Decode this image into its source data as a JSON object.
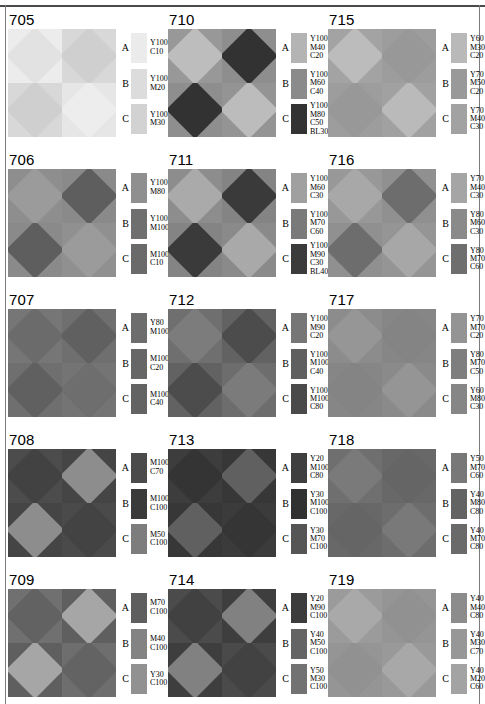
{
  "page": {
    "border_color": "#4a4a4a"
  },
  "panels": [
    {
      "number": "705",
      "swatches": [
        {
          "letter": "A",
          "lines": [
            "Y100",
            "C10"
          ],
          "color": "#ebebeb"
        },
        {
          "letter": "B",
          "lines": [
            "Y100",
            "M20"
          ],
          "color": "#dcdcdc"
        },
        {
          "letter": "C",
          "lines": [
            "Y100",
            "M30"
          ],
          "color": "#d2d2d2"
        }
      ],
      "pattern": {
        "bg": [
          "#ececec",
          "#d8d8d8",
          "#d8d8d8",
          "#e6e6e6"
        ],
        "dia": [
          "#e2e2e2",
          "#cfcfcf",
          "#cfcfcf",
          "#ededed"
        ]
      }
    },
    {
      "number": "706",
      "swatches": [
        {
          "letter": "A",
          "lines": [
            "Y100",
            "M80"
          ],
          "color": "#8f8f8f"
        },
        {
          "letter": "B",
          "lines": [
            "Y100",
            "M100"
          ],
          "color": "#6f6f6f"
        },
        {
          "letter": "C",
          "lines": [
            "M100",
            "C10"
          ],
          "color": "#6a6a6a"
        }
      ],
      "pattern": {
        "bg": [
          "#8e8e8e",
          "#8a8a8a",
          "#8a8a8a",
          "#909090"
        ],
        "dia": [
          "#9b9b9b",
          "#5e5e5e",
          "#5e5e5e",
          "#9b9b9b"
        ]
      }
    },
    {
      "number": "707",
      "swatches": [
        {
          "letter": "A",
          "lines": [
            "Y80",
            "M100"
          ],
          "color": "#6d6d6d"
        },
        {
          "letter": "B",
          "lines": [
            "M100",
            "C20"
          ],
          "color": "#666666"
        },
        {
          "letter": "C",
          "lines": [
            "M100",
            "C40"
          ],
          "color": "#636363"
        }
      ],
      "pattern": {
        "bg": [
          "#767676",
          "#6f6f6f",
          "#6f6f6f",
          "#747474"
        ],
        "dia": [
          "#6b6b6b",
          "#606060",
          "#606060",
          "#6e6e6e"
        ]
      }
    },
    {
      "number": "708",
      "swatches": [
        {
          "letter": "A",
          "lines": [
            "M100",
            "C70"
          ],
          "color": "#4b4b4b"
        },
        {
          "letter": "B",
          "lines": [
            "M100",
            "C100"
          ],
          "color": "#3a3a3a"
        },
        {
          "letter": "C",
          "lines": [
            "M50",
            "C100"
          ],
          "color": "#7d7d7d"
        }
      ],
      "pattern": {
        "bg": [
          "#4c4c4c",
          "#454545",
          "#454545",
          "#4a4a4a"
        ],
        "dia": [
          "#424242",
          "#8d8d8d",
          "#8d8d8d",
          "#434343"
        ]
      }
    },
    {
      "number": "709",
      "swatches": [
        {
          "letter": "A",
          "lines": [
            "M70",
            "C100"
          ],
          "color": "#5e5e5e"
        },
        {
          "letter": "B",
          "lines": [
            "M40",
            "C100"
          ],
          "color": "#838383"
        },
        {
          "letter": "C",
          "lines": [
            "Y30",
            "C100"
          ],
          "color": "#919191"
        }
      ],
      "pattern": {
        "bg": [
          "#707070",
          "#5f5f5f",
          "#5f5f5f",
          "#6e6e6e"
        ],
        "dia": [
          "#626262",
          "#a6a6a6",
          "#a6a6a6",
          "#636363"
        ]
      }
    },
    {
      "number": "710",
      "swatches": [
        {
          "letter": "A",
          "lines": [
            "Y100",
            "M40",
            "C20"
          ],
          "color": "#b4b4b4"
        },
        {
          "letter": "B",
          "lines": [
            "Y100",
            "M60",
            "C40"
          ],
          "color": "#8b8b8b"
        },
        {
          "letter": "C",
          "lines": [
            "Y100",
            "M80",
            "C50",
            "BL30"
          ],
          "color": "#333333"
        }
      ],
      "pattern": {
        "bg": [
          "#989898",
          "#8e8e8e",
          "#8e8e8e",
          "#949494"
        ],
        "dia": [
          "#bdbdbd",
          "#323232",
          "#323232",
          "#bcbcbc"
        ]
      }
    },
    {
      "number": "711",
      "swatches": [
        {
          "letter": "A",
          "lines": [
            "Y100",
            "M60",
            "C30"
          ],
          "color": "#a0a0a0"
        },
        {
          "letter": "B",
          "lines": [
            "Y100",
            "M70",
            "C60"
          ],
          "color": "#7a7a7a"
        },
        {
          "letter": "C",
          "lines": [
            "Y100",
            "M90",
            "C30",
            "BL40"
          ],
          "color": "#3b3b3b"
        }
      ],
      "pattern": {
        "bg": [
          "#8d8d8d",
          "#848484",
          "#848484",
          "#8a8a8a"
        ],
        "dia": [
          "#aaaaaa",
          "#3a3a3a",
          "#3a3a3a",
          "#a9a9a9"
        ]
      }
    },
    {
      "number": "712",
      "swatches": [
        {
          "letter": "A",
          "lines": [
            "Y100",
            "M90",
            "C20"
          ],
          "color": "#767676"
        },
        {
          "letter": "B",
          "lines": [
            "Y100",
            "M100",
            "C40"
          ],
          "color": "#5f5f5f"
        },
        {
          "letter": "C",
          "lines": [
            "Y100",
            "M100",
            "C80"
          ],
          "color": "#4a4a4a"
        }
      ],
      "pattern": {
        "bg": [
          "#6f6f6f",
          "#626262",
          "#626262",
          "#6d6d6d"
        ],
        "dia": [
          "#7c7c7c",
          "#4c4c4c",
          "#4c4c4c",
          "#7b7b7b"
        ]
      }
    },
    {
      "number": "713",
      "swatches": [
        {
          "letter": "A",
          "lines": [
            "Y20",
            "M100",
            "C80"
          ],
          "color": "#3f3f3f"
        },
        {
          "letter": "B",
          "lines": [
            "Y30",
            "M100",
            "C100"
          ],
          "color": "#313131"
        },
        {
          "letter": "C",
          "lines": [
            "Y30",
            "M70",
            "C100"
          ],
          "color": "#555555"
        }
      ],
      "pattern": {
        "bg": [
          "#3d3d3d",
          "#373737",
          "#373737",
          "#3b3b3b"
        ],
        "dia": [
          "#343434",
          "#606060",
          "#606060",
          "#353535"
        ]
      }
    },
    {
      "number": "714",
      "swatches": [
        {
          "letter": "A",
          "lines": [
            "Y20",
            "M90",
            "C100"
          ],
          "color": "#3c3c3c"
        },
        {
          "letter": "B",
          "lines": [
            "Y40",
            "M50",
            "C100"
          ],
          "color": "#646464"
        },
        {
          "letter": "C",
          "lines": [
            "Y50",
            "M30",
            "C100"
          ],
          "color": "#727272"
        }
      ],
      "pattern": {
        "bg": [
          "#4b4b4b",
          "#3e3e3e",
          "#3e3e3e",
          "#4a4a4a"
        ],
        "dia": [
          "#414141",
          "#818181",
          "#818181",
          "#424242"
        ]
      }
    },
    {
      "number": "715",
      "swatches": [
        {
          "letter": "A",
          "lines": [
            "Y60",
            "M30",
            "C20"
          ],
          "color": "#b9b9b9"
        },
        {
          "letter": "B",
          "lines": [
            "Y70",
            "M50",
            "C20"
          ],
          "color": "#999999"
        },
        {
          "letter": "C",
          "lines": [
            "Y70",
            "M40",
            "C30"
          ],
          "color": "#a2a2a2"
        }
      ],
      "pattern": {
        "bg": [
          "#a3a3a3",
          "#9d9d9d",
          "#9d9d9d",
          "#a1a1a1"
        ],
        "dia": [
          "#bcbcbc",
          "#989898",
          "#989898",
          "#bababa"
        ]
      }
    },
    {
      "number": "716",
      "swatches": [
        {
          "letter": "A",
          "lines": [
            "Y70",
            "M40",
            "C30"
          ],
          "color": "#a5a5a5"
        },
        {
          "letter": "B",
          "lines": [
            "Y80",
            "M60",
            "C30"
          ],
          "color": "#8a8a8a"
        },
        {
          "letter": "C",
          "lines": [
            "Y80",
            "M70",
            "C60"
          ],
          "color": "#6e6e6e"
        }
      ],
      "pattern": {
        "bg": [
          "#989898",
          "#909090",
          "#909090",
          "#959595"
        ],
        "dia": [
          "#a8a8a8",
          "#6d6d6d",
          "#6d6d6d",
          "#a7a7a7"
        ]
      }
    },
    {
      "number": "717",
      "swatches": [
        {
          "letter": "A",
          "lines": [
            "Y70",
            "M70",
            "C20"
          ],
          "color": "#949494"
        },
        {
          "letter": "B",
          "lines": [
            "Y80",
            "M70",
            "C50"
          ],
          "color": "#7e7e7e"
        },
        {
          "letter": "C",
          "lines": [
            "Y60",
            "M80",
            "C30"
          ],
          "color": "#868686"
        }
      ],
      "pattern": {
        "bg": [
          "#8c8c8c",
          "#868686",
          "#868686",
          "#8a8a8a"
        ],
        "dia": [
          "#969696",
          "#848484",
          "#848484",
          "#959595"
        ]
      }
    },
    {
      "number": "718",
      "swatches": [
        {
          "letter": "A",
          "lines": [
            "Y50",
            "M70",
            "C60"
          ],
          "color": "#787878"
        },
        {
          "letter": "B",
          "lines": [
            "Y40",
            "M80",
            "C80"
          ],
          "color": "#636363"
        },
        {
          "letter": "C",
          "lines": [
            "Y40",
            "M70",
            "C80"
          ],
          "color": "#6a6a6a"
        }
      ],
      "pattern": {
        "bg": [
          "#6f6f6f",
          "#686868",
          "#686868",
          "#6d6d6d"
        ],
        "dia": [
          "#7a7a7a",
          "#656565",
          "#656565",
          "#797979"
        ]
      }
    },
    {
      "number": "719",
      "swatches": [
        {
          "letter": "A",
          "lines": [
            "Y40",
            "M40",
            "C80"
          ],
          "color": "#8c8c8c"
        },
        {
          "letter": "B",
          "lines": [
            "Y40",
            "M30",
            "C70"
          ],
          "color": "#979797"
        },
        {
          "letter": "C",
          "lines": [
            "Y40",
            "M20",
            "C60"
          ],
          "color": "#a3a3a3"
        }
      ],
      "pattern": {
        "bg": [
          "#9b9b9b",
          "#959595",
          "#959595",
          "#999999"
        ],
        "dia": [
          "#a9a9a9",
          "#919191",
          "#919191",
          "#a8a8a8"
        ]
      }
    }
  ]
}
